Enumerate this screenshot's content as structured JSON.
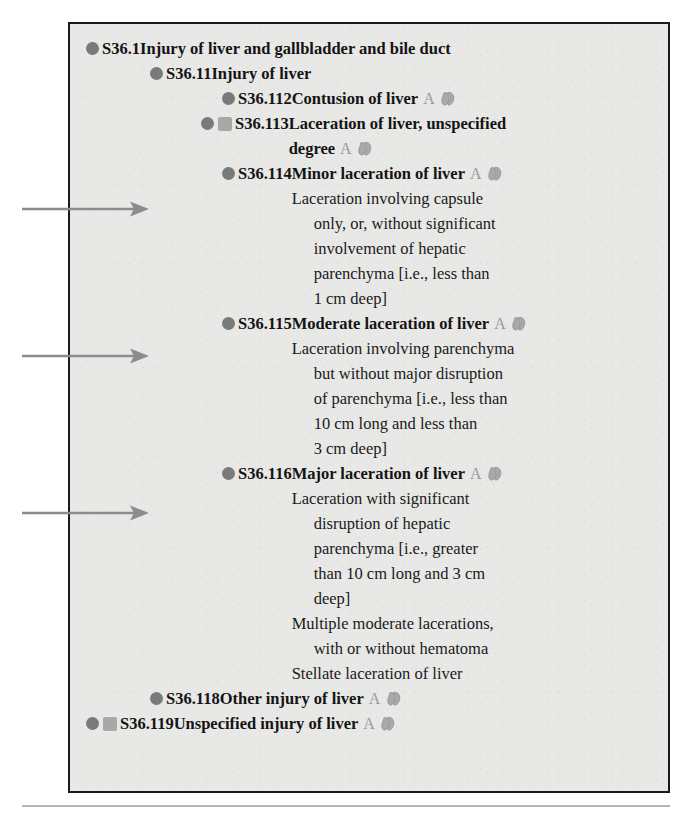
{
  "document": {
    "type": "icd-10-cm-code-listing",
    "box_background": "#e8e8e6",
    "border_color": "#1a1a1a",
    "bullet_color": "#7a7a7a",
    "square_color": "#a8a8a8",
    "badge_color": "#9a9a9a",
    "arrow_color": "#8c8c8c"
  },
  "annotations": {
    "arrows": [
      {
        "name": "arrow-to-s36-114",
        "target_code": "S36.114",
        "top": 201
      },
      {
        "name": "arrow-to-s36-115",
        "target_code": "S36.115",
        "top": 348
      },
      {
        "name": "arrow-to-s36-116",
        "target_code": "S36.116",
        "top": 505
      }
    ]
  },
  "entries": [
    {
      "code": "S36.1",
      "title": "Injury of liver and gallbladder and bile duct",
      "has_square": false,
      "badge": "",
      "has_glyph": false,
      "indent": "ind-0",
      "notes": []
    },
    {
      "code": "S36.11",
      "title": "Injury of liver",
      "has_square": false,
      "badge": "",
      "has_glyph": false,
      "indent": "ind-1",
      "notes": []
    },
    {
      "code": "S36.112",
      "title": "Contusion of liver",
      "has_square": false,
      "badge": "A",
      "has_glyph": true,
      "indent": "ind-2",
      "notes": []
    },
    {
      "code": "S36.113",
      "title": "Laceration of liver, unspecified",
      "title_line2": "degree",
      "has_square": true,
      "badge": "A",
      "has_glyph": true,
      "indent": "ind-2b",
      "notes": []
    },
    {
      "code": "S36.114",
      "title": "Minor laceration of liver",
      "has_square": false,
      "badge": "A",
      "has_glyph": true,
      "indent": "ind-2",
      "notes": [
        [
          "Laceration involving capsule",
          "only, or, without significant",
          "involvement of hepatic",
          "parenchyma [i.e., less than",
          "1 cm deep]"
        ]
      ]
    },
    {
      "code": "S36.115",
      "title": "Moderate laceration of liver",
      "has_square": false,
      "badge": "A",
      "has_glyph": true,
      "indent": "ind-2",
      "notes": [
        [
          "Laceration involving parenchyma",
          "but without major disruption",
          "of parenchyma [i.e., less than",
          "10 cm long and less than",
          "3 cm deep]"
        ]
      ]
    },
    {
      "code": "S36.116",
      "title": "Major laceration of liver",
      "has_square": false,
      "badge": "A",
      "has_glyph": true,
      "indent": "ind-2",
      "notes": [
        [
          "Laceration with significant",
          "disruption of hepatic",
          "parenchyma [i.e., greater",
          "than 10 cm long and 3 cm",
          "deep]"
        ],
        [
          "Multiple moderate lacerations,",
          "with or without hematoma"
        ],
        [
          "Stellate laceration of liver"
        ]
      ]
    },
    {
      "code": "S36.118",
      "title": "Other injury of liver",
      "has_square": false,
      "badge": "A",
      "has_glyph": true,
      "indent": "ind-1",
      "notes": []
    },
    {
      "code": "S36.119",
      "title": "Unspecified injury of liver",
      "has_square": true,
      "badge": "A",
      "has_glyph": true,
      "indent": "ind-0",
      "notes": []
    }
  ]
}
